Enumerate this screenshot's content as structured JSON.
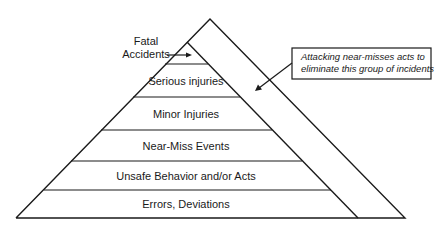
{
  "diagram": {
    "type": "safety-pyramid",
    "tiers": [
      {
        "label": "Fatal Accidents",
        "rank": 1
      },
      {
        "label": "Serious injuries",
        "rank": 2
      },
      {
        "label": "Minor Injuries",
        "rank": 3
      },
      {
        "label": "Near-Miss Events",
        "rank": 4
      },
      {
        "label": "Unsafe Behavior and/or Acts",
        "rank": 5
      },
      {
        "label": "Errors, Deviations",
        "rank": 6
      }
    ],
    "fatal_label_line1": "Fatal",
    "fatal_label_line2": "Accidents",
    "callout_line1": "Attacking near-misses acts to",
    "callout_line2": "eliminate this group of incidents",
    "colors": {
      "stroke": "#1a1a1a",
      "background": "#ffffff"
    }
  }
}
